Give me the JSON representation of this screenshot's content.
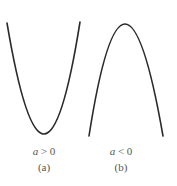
{
  "panels": [
    {
      "id": "a",
      "condition_var": "a",
      "condition_op": " > 0",
      "caption": "(a)",
      "shape": "upward parabola",
      "curve": {
        "start": [
          7,
          23
        ],
        "vertex": [
          44,
          134
        ],
        "end": [
          80,
          22
        ]
      }
    },
    {
      "id": "b",
      "condition_var": "a",
      "condition_op": " < 0",
      "caption": "(b)",
      "shape": "downward parabola",
      "curve": {
        "start": [
          89,
          136
        ],
        "vertex": [
          125,
          24
        ],
        "end": [
          163,
          136
        ]
      }
    }
  ],
  "colors": {
    "stroke": "#2a2a2a",
    "text": "#555555",
    "background": "#ffffff"
  }
}
